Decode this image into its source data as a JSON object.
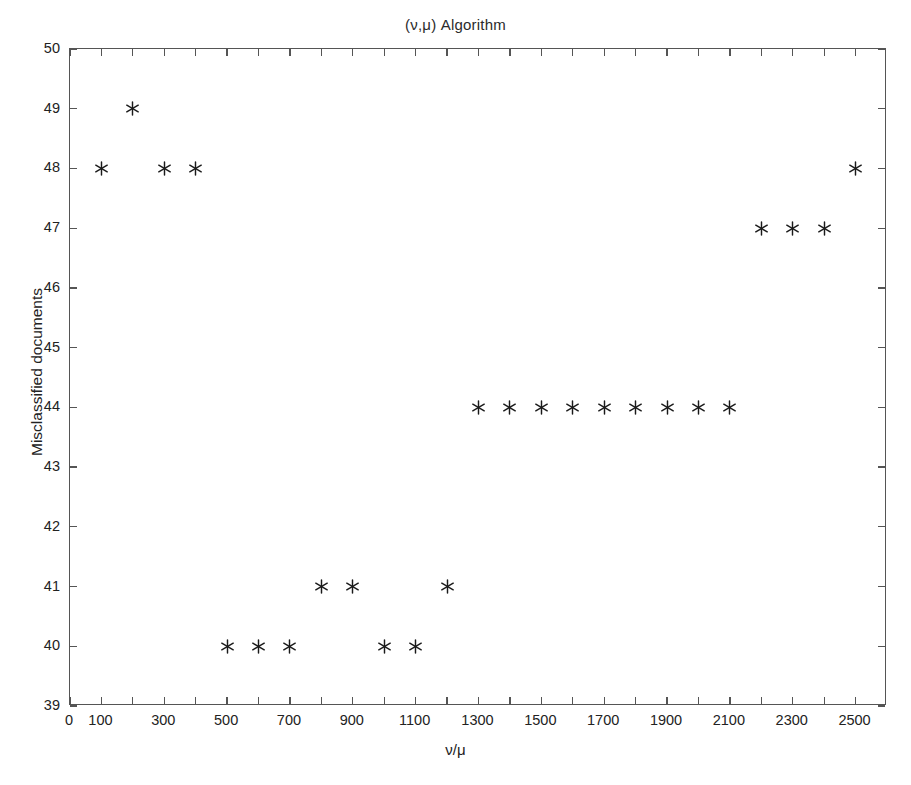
{
  "chart_data": {
    "type": "scatter",
    "title": "(ν,μ) Algorithm",
    "xlabel": "ν/μ",
    "ylabel": "Misclassified documents",
    "xlim": [
      0,
      2600
    ],
    "ylim": [
      39,
      50
    ],
    "grid": false,
    "legend": null,
    "marker": "asterisk",
    "marker_color": "#1a1a1a",
    "xticks": [
      0,
      100,
      300,
      500,
      700,
      900,
      1100,
      1300,
      1500,
      1700,
      1900,
      2100,
      2300,
      2500
    ],
    "xticklabels": [
      "0",
      "100",
      "300",
      "500",
      "700",
      "900",
      "1100",
      "1300",
      "1500",
      "1700",
      "1900",
      "2100",
      "2300",
      "2500"
    ],
    "xticks_minor": [
      200,
      400,
      600,
      800,
      1000,
      1200,
      1400,
      1600,
      1800,
      2000,
      2200,
      2400
    ],
    "yticks": [
      39,
      40,
      41,
      42,
      43,
      44,
      45,
      46,
      47,
      48,
      49,
      50
    ],
    "yticklabels": [
      "39",
      "40",
      "41",
      "42",
      "43",
      "44",
      "45",
      "46",
      "47",
      "48",
      "49",
      "50"
    ],
    "series": [
      {
        "name": "Misclassified documents",
        "x": [
          100,
          200,
          300,
          400,
          500,
          600,
          700,
          800,
          900,
          1000,
          1100,
          1200,
          1300,
          1400,
          1500,
          1600,
          1700,
          1800,
          1900,
          2000,
          2100,
          2200,
          2300,
          2400,
          2500
        ],
        "y": [
          48,
          49,
          48,
          48,
          40,
          40,
          40,
          41,
          41,
          40,
          40,
          41,
          44,
          44,
          44,
          44,
          44,
          44,
          44,
          44,
          44,
          47,
          47,
          47,
          48
        ]
      }
    ]
  }
}
